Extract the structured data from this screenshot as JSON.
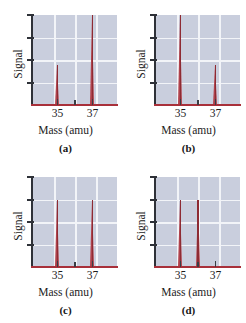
{
  "figure": {
    "axis_label_y": "Signal",
    "axis_label_x": "Mass (amu)",
    "plot_bg_color": "#c9cedd",
    "grid_color": "#f2f4f8",
    "axis_color": "#2e3138",
    "baseline_color": "#a8303a",
    "peak_color": "#b0414b",
    "peak_core_color": "#8e2b33"
  },
  "chart_data": [
    {
      "type": "bar",
      "panel": "(a)",
      "title": "",
      "xlabel": "Mass (amu)",
      "ylabel": "Signal",
      "xlim": [
        33.6,
        38.4
      ],
      "ylim": [
        0,
        100
      ],
      "xticklabels": [
        "35",
        "37"
      ],
      "xtickvalues": [
        35,
        37
      ],
      "minor_xtickvalues": [
        36
      ],
      "grid": true,
      "categories": [
        35,
        37
      ],
      "values": [
        45,
        100
      ],
      "legend": "none"
    },
    {
      "type": "bar",
      "panel": "(b)",
      "title": "",
      "xlabel": "Mass (amu)",
      "ylabel": "Signal",
      "xlim": [
        33.6,
        38.4
      ],
      "ylim": [
        0,
        100
      ],
      "xticklabels": [
        "35",
        "37"
      ],
      "xtickvalues": [
        35,
        37
      ],
      "minor_xtickvalues": [
        36
      ],
      "grid": true,
      "categories": [
        35,
        37
      ],
      "values": [
        100,
        45
      ],
      "legend": "none"
    },
    {
      "type": "bar",
      "panel": "(c)",
      "title": "",
      "xlabel": "Mass (amu)",
      "ylabel": "Signal",
      "xlim": [
        33.6,
        38.4
      ],
      "ylim": [
        0,
        100
      ],
      "xticklabels": [
        "35",
        "37"
      ],
      "xtickvalues": [
        35,
        37
      ],
      "minor_xtickvalues": [
        36
      ],
      "grid": true,
      "categories": [
        35,
        37
      ],
      "values": [
        75,
        75
      ],
      "legend": "none"
    },
    {
      "type": "bar",
      "panel": "(d)",
      "title": "",
      "xlabel": "Mass (amu)",
      "ylabel": "Signal",
      "xlim": [
        33.6,
        38.4
      ],
      "ylim": [
        0,
        100
      ],
      "xticklabels": [
        "35",
        "37"
      ],
      "xtickvalues": [
        35,
        37
      ],
      "minor_xtickvalues": [
        36
      ],
      "grid": true,
      "categories": [
        35,
        36
      ],
      "values": [
        75,
        75
      ],
      "legend": "none"
    }
  ]
}
